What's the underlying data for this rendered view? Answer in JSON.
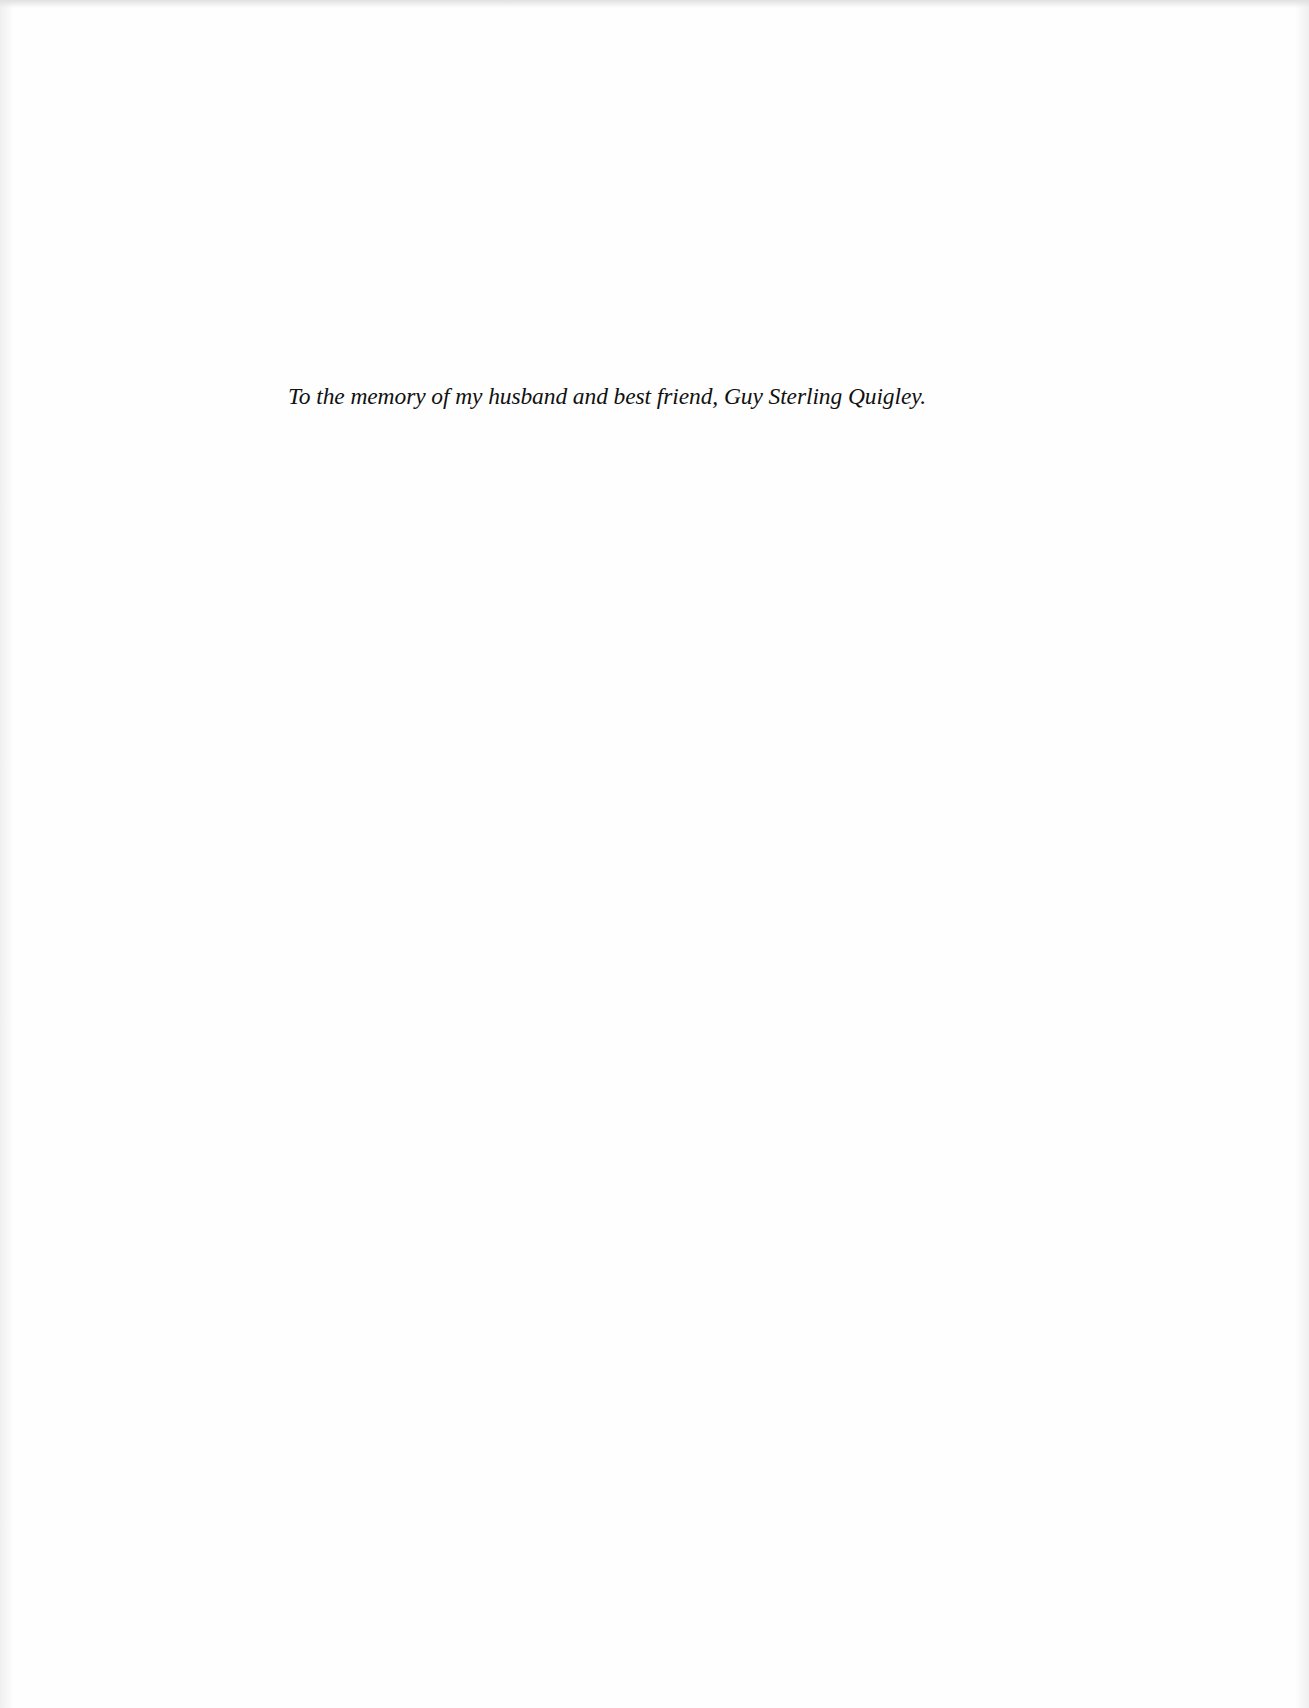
{
  "page": {
    "dedication": "To the memory of my husband and best friend, Guy Sterling Quigley."
  }
}
